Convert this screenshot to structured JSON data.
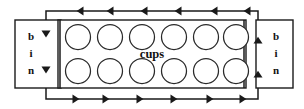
{
  "diagram": {
    "type": "schematic-flow-diagram",
    "canvas": {
      "width": 304,
      "height": 109,
      "background": "#ffffff"
    },
    "stroke_color": "#1a1a1a",
    "labels": {
      "left_bin": [
        "b",
        "i",
        "n"
      ],
      "right_bin": [
        "b",
        "i",
        "n"
      ],
      "cups": "cups"
    },
    "left_bin": {
      "name": "bin",
      "x": 15,
      "y": 20,
      "width": 46,
      "height": 68,
      "label_lines": [
        "b",
        "i",
        "n"
      ],
      "label_x": 31,
      "label_ys": [
        40,
        57,
        74
      ]
    },
    "right_bin": {
      "name": "bin",
      "x": 256,
      "y": 20,
      "width": 37,
      "height": 68,
      "label_lines": [
        "b",
        "i",
        "n"
      ],
      "label_x": 276,
      "label_ys": [
        40,
        57,
        74
      ]
    },
    "cups_box": {
      "name": "cups",
      "x": 58,
      "y": 20,
      "width": 188,
      "height": 68,
      "label": "cups",
      "label_x": 152,
      "label_y": 58,
      "inner_left_x": 60,
      "inner_right_x": 244
    },
    "cups": {
      "rows": 2,
      "columns": 6,
      "total": 12,
      "radius": 12.5,
      "row_center_ys": [
        37,
        71
      ],
      "column_center_xs": [
        78,
        110,
        142,
        174,
        206,
        236
      ]
    },
    "loop_path": {
      "description": "closed rectangular circulation loop",
      "left_x": 46,
      "right_x": 258,
      "top_y": 11,
      "bottom_y": 99,
      "top_direction": "left",
      "bottom_direction": "right",
      "left_direction": "down",
      "right_direction": "up",
      "top_arrow_xs": [
        78,
        108,
        142,
        176,
        212,
        245
      ],
      "bottom_arrow_xs": [
        78,
        108,
        142,
        176,
        212,
        245
      ],
      "left_arrow_ys": [
        36,
        72
      ],
      "right_arrow_ys": [
        38,
        72
      ],
      "arrow_size": 5.5
    }
  }
}
